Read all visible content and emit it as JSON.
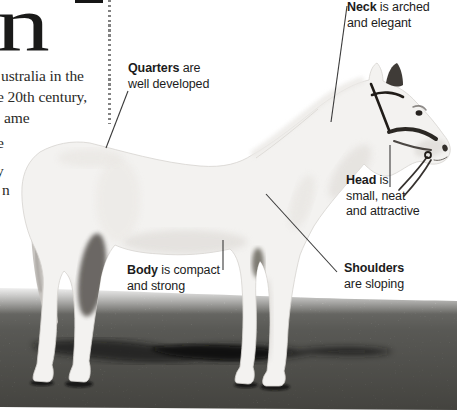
{
  "left_column": {
    "big_letter": "n",
    "lines": [
      "ustralia in the",
      "e 20th century,",
      "ame"
    ],
    "fragments": [
      "e",
      "y",
      "n"
    ]
  },
  "annotations": {
    "neck": {
      "term": "Neck",
      "rest": " is arched",
      "line2": "and elegant"
    },
    "quarters": {
      "term": "Quarters",
      "rest": " are",
      "line2": "well developed"
    },
    "head": {
      "term": "Head",
      "rest": " is",
      "line2": "small, neat",
      "line3": "and attractive"
    },
    "body": {
      "term": "Body",
      "rest": " is compact",
      "line2": "and strong"
    },
    "shoulders": {
      "term": "Shoulders",
      "rest": "",
      "line2": "are sloping"
    }
  },
  "photo": {
    "subject": "light grey pony standing side-on, facing right, wearing a dark bridle",
    "ground": "grass field with cast shadow"
  },
  "colors": {
    "label_text": "#1c1c1c",
    "serif_text": "#2b2b28",
    "leader_line": "#3a3a3a",
    "divider_dot": "#828282",
    "horse_body": "#f3f2f0",
    "grass_light": "#c9c8c2",
    "grass_dark": "#6e6d66",
    "shadow": "#141412"
  }
}
